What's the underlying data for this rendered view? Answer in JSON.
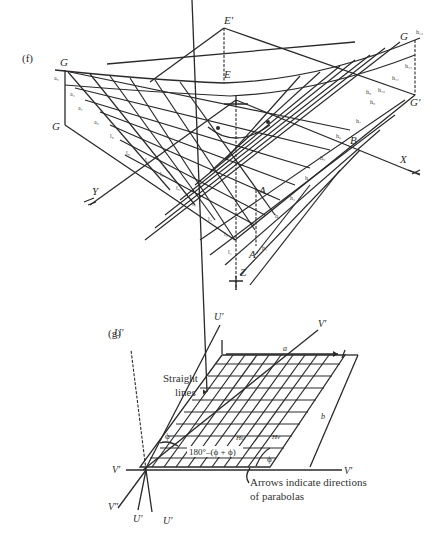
{
  "figure_f": {
    "panel_label": "(f)",
    "points": {
      "E_prime": "E′",
      "E": "E",
      "G_top_left": "G",
      "G_bottom_left": "G",
      "G_top_right": "G",
      "G_prime_right": "G′",
      "B": "B",
      "A": "A",
      "A_prime": "A′"
    },
    "axes": {
      "x": "X",
      "y": "Y",
      "z": "Z"
    },
    "left_edge_ticks": [
      "a₅",
      "a₃",
      "a₁",
      "a₀",
      "l₉",
      "l₈"
    ],
    "lower_left_ticks": [
      "l₇",
      "l₆",
      "l₅",
      "l₄",
      "l₃",
      "l₂",
      "l₁"
    ],
    "right_edge_ticks": [
      "h₁₃",
      "h₁₂",
      "h₁₁",
      "h₁₀",
      "h₉",
      "h₈",
      "h₇",
      "h₆",
      "h₅",
      "h₄",
      "h₃",
      "h₂",
      "h₁"
    ]
  },
  "figure_g": {
    "panel_label": "(g)",
    "axes": {
      "u_top_left": "U′",
      "u_top_mid": "U′",
      "v_top_right": "V′",
      "v_left": "V′",
      "v_right": "V′",
      "v_double": "V″",
      "u_bottom_left": "U′",
      "u_bottom_right": "U′"
    },
    "dimensions": {
      "a": "a",
      "b": "b"
    },
    "angles": {
      "phi": "ϕ",
      "phi_right": "ϕ",
      "supplement": "180°–(ϕ + ϕ)",
      "hu": "Hᴜ",
      "hv": "Hᴠ"
    },
    "annotations": {
      "straight_lines_1": "Straight",
      "straight_lines_2": "lines",
      "arrows_note_1": "Arrows indicate directions",
      "arrows_note_2": "of parabolas"
    }
  }
}
